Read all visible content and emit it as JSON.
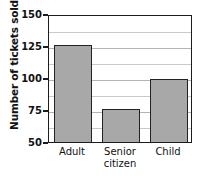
{
  "chart_data": {
    "type": "bar",
    "title": "Number of tickets sold",
    "title_clipped": true,
    "xlabel": "",
    "ylabel": "Number of tickets sold",
    "categories": [
      "Adult",
      "Senior citizen",
      "Child"
    ],
    "values": [
      126,
      76,
      99
    ],
    "ylim": [
      50,
      150
    ],
    "ytick_labels": [
      "150",
      "125",
      "100",
      "75",
      "50"
    ],
    "ytick_values": [
      150,
      125,
      100,
      75,
      50
    ],
    "ytick_step": 25,
    "gridline_step": 12.5,
    "grid": true,
    "legend": "none",
    "bar_fill_color": "#a8a8a8",
    "bar_edge_color": "#222222",
    "axis_color": "#1c1c1c",
    "gridline_color": "#c9c9c9",
    "background_color": "#ffffff"
  },
  "axis": {
    "y_title": "Number of tickets sold"
  },
  "x_labels": [
    {
      "line1": "Adult",
      "line2": ""
    },
    {
      "line1": "Senior",
      "line2": "citizen"
    },
    {
      "line1": "Child",
      "line2": ""
    }
  ]
}
